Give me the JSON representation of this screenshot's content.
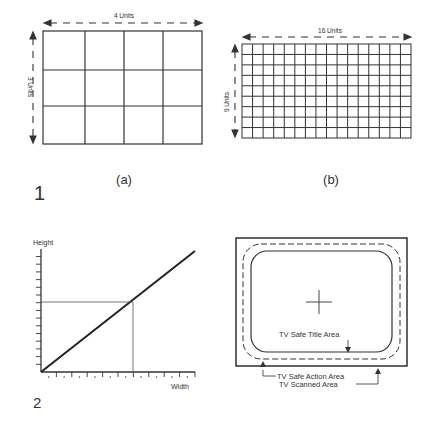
{
  "figure1": {
    "number": "1",
    "panel_a": {
      "caption": "(a)",
      "width_label": "4 Units",
      "height_label": "3 Units",
      "cols": 4,
      "rows": 3
    },
    "panel_b": {
      "caption": "(b)",
      "width_label": "16 Units",
      "height_label": "9 Units",
      "cols": 16,
      "rows": 9
    }
  },
  "figure2": {
    "number": "2",
    "graph": {
      "y_label": "Height",
      "x_label": "Width",
      "x_ticks": 10,
      "y_ticks": 8
    },
    "tv": {
      "title_area_label": "TV Safe Title Area",
      "action_area_label": "TV Safe Action Area",
      "scanned_area_label": "TV Scanned Area"
    }
  },
  "colors": {
    "ink": "#222222",
    "background": "#ffffff"
  }
}
